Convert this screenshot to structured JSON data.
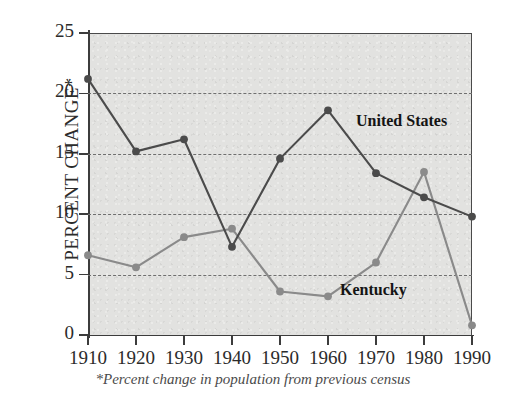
{
  "chart_data": {
    "type": "line",
    "title": "",
    "xlabel": "",
    "ylabel": "PERCENT CHANGE*",
    "footnote": "*Percent change in population from previous census",
    "categories": [
      "1910",
      "1920",
      "1930",
      "1940",
      "1950",
      "1960",
      "1970",
      "1980",
      "1990"
    ],
    "x": [
      1910,
      1920,
      1930,
      1940,
      1950,
      1960,
      1970,
      1980,
      1990
    ],
    "xlim": [
      1910,
      1990
    ],
    "ylim": [
      0,
      25
    ],
    "yticks": [
      0,
      5,
      10,
      15,
      20,
      25
    ],
    "ytick_labels": [
      "0",
      "5",
      "10",
      "15",
      "20",
      "25"
    ],
    "grid": "horizontal-dashed",
    "legend": "inline-annotations",
    "series": [
      {
        "name": "United States",
        "color": "#4b4b4b",
        "label_position": "right-of-1960-peak",
        "values": [
          21.2,
          15.2,
          16.2,
          7.3,
          14.6,
          18.6,
          13.4,
          11.4,
          9.8
        ]
      },
      {
        "name": "Kentucky",
        "color": "#8a8a8a",
        "label_position": "below-1970",
        "values": [
          6.6,
          5.6,
          8.1,
          8.8,
          3.6,
          3.2,
          6.0,
          13.5,
          0.8
        ]
      }
    ]
  },
  "labels": {
    "united_states": "United States",
    "kentucky": "Kentucky"
  },
  "colors": {
    "plot_background": "#e2e2e0",
    "axis": "#3c3c3c",
    "gridline": "#6f6f6f",
    "united_states_line": "#4b4b4b",
    "kentucky_line": "#8a8a8a",
    "text": "#2b2b2b"
  }
}
